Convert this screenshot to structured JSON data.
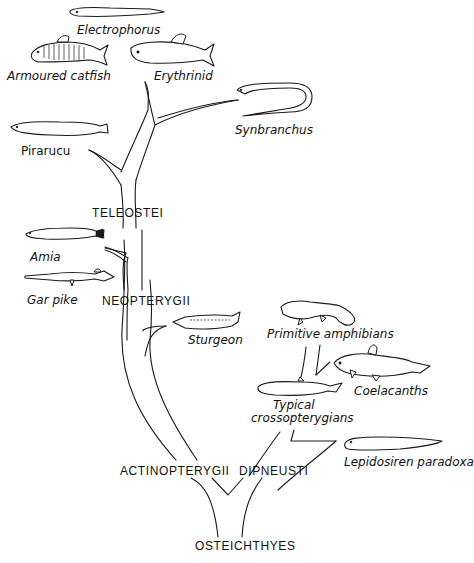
{
  "diagram": {
    "root": "OSTEICHTHYES",
    "clades": {
      "actinopterygii": "ACTINOPTERYGII",
      "dipneusti": "DIPNEUSTI",
      "neopterygii": "NEOPTERYGII",
      "teleostei": "TELEOSTEI"
    },
    "species": {
      "electrophorus": "Electrophorus",
      "armoured_catfish": "Armoured catfish",
      "erythrinid": "Erythrinid",
      "synbranchus": "Synbranchus",
      "pirarucu": "Pirarucu",
      "amia": "Amia",
      "gar_pike": "Gar pike",
      "sturgeon": "Sturgeon",
      "primitive_amphibians": "Primitive amphibians",
      "coelacanths": "Coelacanths",
      "typical_crossopterygians_1": "Typical",
      "typical_crossopterygians_2": "crossopterygians",
      "lepidosiren": "Lepidosiren paradoxa"
    }
  }
}
